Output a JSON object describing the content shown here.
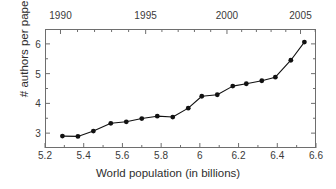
{
  "chart_data": {
    "type": "line",
    "title": "",
    "xlabel": "World population (in billions)",
    "ylabel": "# authors per paper",
    "xlim": [
      5.2,
      6.6
    ],
    "ylim": [
      2.5,
      6.5
    ],
    "grid": false,
    "legend": null,
    "marker": "filled-circle",
    "line_color": "#111111",
    "marker_color": "#111111",
    "x_ticks": [
      "5.2",
      "5.4",
      "5.6",
      "5.8",
      "6",
      "6.2",
      "6.4",
      "6.6"
    ],
    "x_tick_values": [
      5.2,
      5.4,
      5.6,
      5.8,
      6.0,
      6.2,
      6.4,
      6.6
    ],
    "x_minor_tick_values": [
      5.3,
      5.5,
      5.7,
      5.9,
      6.1,
      6.3,
      6.5
    ],
    "y_ticks": [
      "3",
      "4",
      "5",
      "6"
    ],
    "y_tick_values": [
      3,
      4,
      5,
      6
    ],
    "y_minor_tick_values": [
      2.5,
      3.5,
      4.5,
      5.5,
      6.5
    ],
    "secondary_x_axis": {
      "position": "top",
      "label": "",
      "ticks": [
        "1990",
        "1995",
        "2000",
        "2005"
      ],
      "tick_values": [
        1990,
        1995,
        2000,
        2005
      ],
      "tick_population_values": [
        5.28,
        5.72,
        6.14,
        6.52
      ],
      "minor_tick_count_between": 4
    },
    "x": [
      5.29,
      5.37,
      5.45,
      5.54,
      5.62,
      5.7,
      5.78,
      5.86,
      5.94,
      6.01,
      6.09,
      6.17,
      6.24,
      6.32,
      6.39,
      6.47,
      6.54
    ],
    "values": [
      2.9,
      2.89,
      3.07,
      3.33,
      3.38,
      3.49,
      3.57,
      3.54,
      3.84,
      4.24,
      4.29,
      4.58,
      4.66,
      4.76,
      4.88,
      5.45,
      6.06
    ],
    "series": [
      {
        "name": "authors per paper",
        "x": [
          5.29,
          5.37,
          5.45,
          5.54,
          5.62,
          5.7,
          5.78,
          5.86,
          5.94,
          6.01,
          6.09,
          6.17,
          6.24,
          6.32,
          6.39,
          6.47,
          6.54
        ],
        "values": [
          2.9,
          2.89,
          3.07,
          3.33,
          3.38,
          3.49,
          3.57,
          3.54,
          3.84,
          4.24,
          4.29,
          4.58,
          4.66,
          4.76,
          4.88,
          5.45,
          6.06
        ]
      }
    ]
  },
  "style": {
    "axis_color": "#6e6e6e",
    "text_color": "#2e2e2e",
    "background": "#ffffff"
  }
}
